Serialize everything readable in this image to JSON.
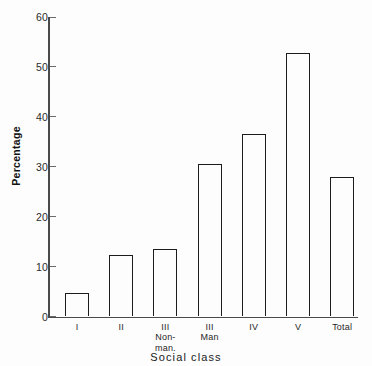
{
  "chart_data": {
    "type": "bar",
    "title": "",
    "xlabel": "Social class",
    "ylabel": "Percentage",
    "categories": [
      "I",
      "II",
      "III Non-man.",
      "III Man",
      "IV",
      "V",
      "Total"
    ],
    "category_lines": [
      [
        "I"
      ],
      [
        "II"
      ],
      [
        "III",
        "Non-",
        "man."
      ],
      [
        "III",
        "Man"
      ],
      [
        "IV"
      ],
      [
        "V"
      ],
      [
        "Total"
      ]
    ],
    "values": [
      4.7,
      12.3,
      13.6,
      30.6,
      36.6,
      52.8,
      27.9
    ],
    "ylim": [
      0,
      60
    ],
    "yticks": [
      0,
      10,
      20,
      30,
      40,
      50,
      60
    ],
    "ytick_labels": [
      "0",
      "10",
      "20",
      "30",
      "40",
      "50",
      "60"
    ],
    "grid": false,
    "legend": null,
    "bar_fill": "#fdfdfd",
    "bar_edge": "#1c1c1c",
    "axis_color": "#4a4a4a",
    "background": "#fdfdfd"
  }
}
